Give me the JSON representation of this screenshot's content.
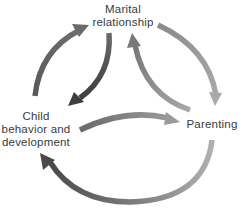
{
  "diagram": {
    "type": "cyclic-relationship-diagram",
    "nodes": [
      {
        "id": "marital",
        "label_lines": [
          "Marital",
          "relationship"
        ]
      },
      {
        "id": "child",
        "label_lines": [
          "Child",
          "behavior and",
          "development"
        ]
      },
      {
        "id": "parenting",
        "label_lines": [
          "Parenting"
        ]
      }
    ],
    "edges": [
      {
        "from": "child",
        "to": "marital",
        "path": "outer-left"
      },
      {
        "from": "marital",
        "to": "child",
        "path": "inner-left"
      },
      {
        "from": "marital",
        "to": "parenting",
        "path": "outer-right"
      },
      {
        "from": "parenting",
        "to": "marital",
        "path": "inner-right"
      },
      {
        "from": "child",
        "to": "parenting",
        "path": "inner-bottom"
      },
      {
        "from": "parenting",
        "to": "child",
        "path": "outer-bottom"
      }
    ],
    "colors": {
      "text": "#3a3a3a",
      "arrow_dark": "#4a4a4a",
      "arrow_mid": "#7a7a7a",
      "arrow_light": "#a8a8a8",
      "background": "#ffffff"
    }
  }
}
